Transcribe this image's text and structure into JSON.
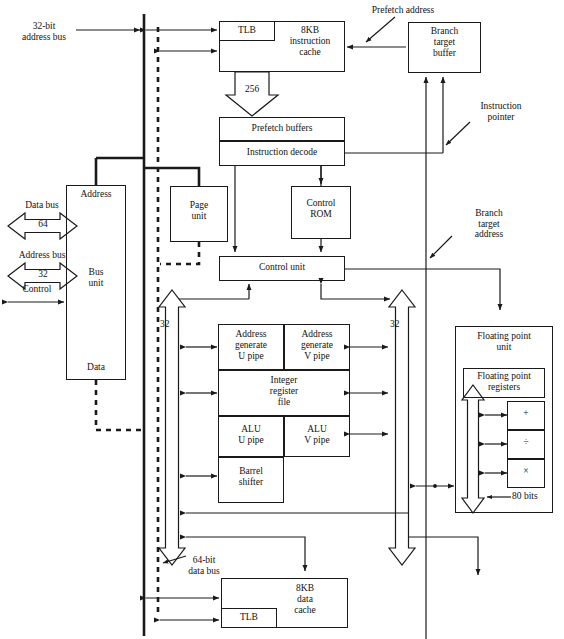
{
  "diagram": {
    "blocks": {
      "instruction_cache": {
        "label": "8KB\ninstruction\ncache",
        "line1": "8KB",
        "line2": "instruction",
        "line3": "cache"
      },
      "instruction_tlb": {
        "label": "TLB"
      },
      "branch_target_buffer": {
        "line1": "Branch",
        "line2": "target",
        "line3": "buffer"
      },
      "prefetch_buffers": {
        "label": "Prefetch buffers"
      },
      "instruction_decode": {
        "label": "Instruction decode"
      },
      "page_unit": {
        "line1": "Page",
        "line2": "unit"
      },
      "control_rom": {
        "line1": "Control",
        "line2": "ROM"
      },
      "control_unit": {
        "label": "Control unit"
      },
      "bus_unit": {
        "top": "Address",
        "middle1": "Bus",
        "middle2": "unit",
        "bottom": "Data"
      },
      "addr_gen_u": {
        "line1": "Address",
        "line2": "generate",
        "line3": "U pipe"
      },
      "addr_gen_v": {
        "line1": "Address",
        "line2": "generate",
        "line3": "V pipe"
      },
      "integer_register_file": {
        "line1": "Integer",
        "line2": "register",
        "line3": "file"
      },
      "alu_u": {
        "line1": "ALU",
        "line2": "U pipe"
      },
      "alu_v": {
        "line1": "ALU",
        "line2": "V pipe"
      },
      "barrel_shifter": {
        "line1": "Barrel",
        "line2": "shifter"
      },
      "floating_point_unit": {
        "line1": "Floating point",
        "line2": "unit"
      },
      "floating_point_registers": {
        "line1": "Floating point",
        "line2": "registers"
      },
      "fpu_add": {
        "label": "+"
      },
      "fpu_div": {
        "label": "÷"
      },
      "fpu_mul": {
        "label": "×"
      },
      "data_cache": {
        "line1": "8KB",
        "line2": "data",
        "line3": "cache"
      },
      "data_tlb": {
        "label": "TLB"
      }
    },
    "annotations": {
      "address_bus_32bit": {
        "line1": "32-bit",
        "line2": "address bus"
      },
      "prefetch_address": {
        "label": "Prefetch address"
      },
      "instruction_pointer": {
        "line1": "Instruction",
        "line2": "pointer"
      },
      "branch_target_address": {
        "line1": "Branch",
        "line2": "target",
        "line3": "address"
      },
      "data_bus": {
        "label": "Data bus"
      },
      "data_bus_width": {
        "label": "64"
      },
      "address_bus": {
        "label": "Address bus"
      },
      "address_bus_width": {
        "label": "32"
      },
      "control": {
        "label": "Control"
      },
      "cache_width_256": {
        "label": "256"
      },
      "control_bus_left_32": {
        "label": "32"
      },
      "control_bus_right_32": {
        "label": "32"
      },
      "data_bus_64bit": {
        "line1": "64-bit",
        "line2": "data bus"
      },
      "fpu_width_80bits": {
        "label": "80 bits"
      }
    }
  }
}
